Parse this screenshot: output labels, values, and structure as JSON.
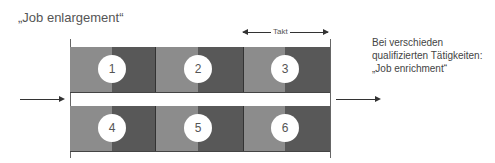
{
  "title": "„Job enlargement“",
  "side_text": [
    "Bei verschieden",
    "qualifizierten Tätigkeiten:",
    "„Job enrichment“"
  ],
  "takt_label": "Takt",
  "stations_top": [
    "1",
    "2",
    "3"
  ],
  "stations_bottom": [
    "4",
    "5",
    "6"
  ],
  "colors": {
    "light": "#8c8c8c",
    "dark": "#585858"
  }
}
